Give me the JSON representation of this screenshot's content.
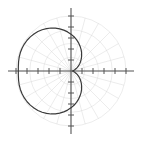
{
  "figure": {
    "title": "Polar Plot",
    "title_clipped": true,
    "background_color": "#ffffff",
    "width": 141,
    "height": 142
  },
  "chart_data": {
    "type": "line",
    "subtype": "polar",
    "title": "Polar Plot",
    "xlabel": "",
    "ylabel": "",
    "grid": true,
    "grid_style": "polar",
    "legend": false,
    "legend_position": "none",
    "curve_color": "#3a3a3a",
    "axis_color": "#555555",
    "grid_color": "#d8d8d8",
    "polar_grid": {
      "radial_rings": [
        0.25,
        0.5,
        0.75,
        1.0
      ],
      "max_radius": 1.0,
      "angular_spokes_deg": [
        0,
        15,
        30,
        45,
        60,
        75,
        90,
        105,
        120,
        135,
        150,
        165,
        180,
        195,
        210,
        225,
        240,
        255,
        270,
        285,
        300,
        315,
        330,
        345
      ]
    },
    "cartesian_axes": {
      "x_range": [
        -1.0,
        1.0
      ],
      "y_range": [
        -1.0,
        1.0
      ],
      "x_ticks": [
        -1.0,
        -0.8,
        -0.6,
        -0.4,
        -0.2,
        0.2,
        0.4,
        0.6,
        0.8,
        1.0
      ],
      "y_ticks": [
        -1.0,
        -0.8,
        -0.6,
        -0.4,
        -0.2,
        0.2,
        0.4,
        0.6,
        0.8,
        1.0
      ],
      "x_tick_labels": [],
      "y_tick_labels": [],
      "origin": [
        0,
        0
      ]
    },
    "equation": "r = a - b*cos(theta)",
    "series": [
      {
        "name": "limacon",
        "theta_deg": [
          0,
          5,
          10,
          15,
          20,
          25,
          30,
          35,
          40,
          45,
          50,
          55,
          60,
          65,
          70,
          75,
          80,
          85,
          90,
          95,
          100,
          105,
          110,
          115,
          120,
          125,
          130,
          135,
          140,
          145,
          150,
          155,
          160,
          165,
          170,
          175,
          180,
          185,
          190,
          195,
          200,
          205,
          210,
          215,
          220,
          225,
          230,
          235,
          240,
          245,
          250,
          255,
          260,
          265,
          270,
          275,
          280,
          285,
          290,
          295,
          300,
          305,
          310,
          315,
          320,
          325,
          330,
          335,
          340,
          345,
          350,
          355,
          360
        ],
        "r": [
          0.03,
          0.033,
          0.042,
          0.057,
          0.078,
          0.104,
          0.134,
          0.169,
          0.207,
          0.248,
          0.292,
          0.337,
          0.385,
          0.433,
          0.481,
          0.53,
          0.578,
          0.625,
          0.67,
          0.714,
          0.755,
          0.794,
          0.829,
          0.862,
          0.89,
          0.915,
          0.936,
          0.953,
          0.966,
          0.975,
          0.98,
          0.982,
          0.98,
          0.975,
          0.968,
          0.961,
          0.958,
          0.961,
          0.968,
          0.975,
          0.98,
          0.982,
          0.98,
          0.975,
          0.966,
          0.953,
          0.936,
          0.915,
          0.89,
          0.862,
          0.829,
          0.794,
          0.755,
          0.714,
          0.67,
          0.625,
          0.578,
          0.53,
          0.481,
          0.433,
          0.385,
          0.337,
          0.292,
          0.248,
          0.207,
          0.169,
          0.134,
          0.104,
          0.078,
          0.057,
          0.042,
          0.033,
          0.03
        ]
      }
    ]
  }
}
